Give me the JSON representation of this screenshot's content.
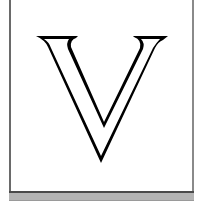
{
  "illustration": {
    "letter": "V",
    "style": "outlined-serif-drop-cap",
    "stroke_color": "#000000",
    "fill_color": "#ffffff"
  },
  "frame": {
    "border_color": "#6a6a6a",
    "bar_color": "#b4b4b4"
  }
}
